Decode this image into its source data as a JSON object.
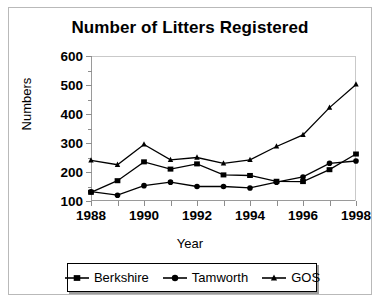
{
  "chart_data": {
    "type": "line",
    "title": "Number of Litters Registered",
    "xlabel": "Year",
    "ylabel": "Numbers",
    "x": [
      1988,
      1989,
      1990,
      1991,
      1992,
      1993,
      1994,
      1995,
      1996,
      1997,
      1998
    ],
    "xtick_labels": [
      "1988",
      "",
      "1990",
      "",
      "1992",
      "",
      "1994",
      "",
      "1996",
      "",
      "1998"
    ],
    "xlim": [
      1988,
      1998
    ],
    "ylim": [
      100,
      600
    ],
    "ytick_labels": [
      "100",
      "200",
      "300",
      "400",
      "500",
      "600"
    ],
    "ytick_values": [
      100,
      200,
      300,
      400,
      500,
      600
    ],
    "yminor_values": [
      150,
      250,
      350,
      450,
      550
    ],
    "grid": false,
    "legend_position": "bottom",
    "series": [
      {
        "name": "Berkshire",
        "marker": "square",
        "color": "#000000",
        "values": [
          130,
          170,
          235,
          210,
          228,
          190,
          188,
          168,
          167,
          208,
          262
        ]
      },
      {
        "name": "Tamworth",
        "marker": "circle",
        "color": "#000000",
        "values": [
          132,
          120,
          153,
          165,
          150,
          150,
          145,
          165,
          183,
          230,
          238
        ]
      },
      {
        "name": "GOS",
        "marker": "triangle",
        "color": "#000000",
        "values": [
          240,
          225,
          295,
          242,
          250,
          230,
          242,
          288,
          328,
          422,
          502
        ]
      }
    ]
  },
  "legend": {
    "entries": [
      {
        "label": "Berkshire",
        "marker": "square-marker-icon"
      },
      {
        "label": "Tamworth",
        "marker": "circle-marker-icon"
      },
      {
        "label": "GOS",
        "marker": "triangle-marker-icon"
      }
    ]
  }
}
